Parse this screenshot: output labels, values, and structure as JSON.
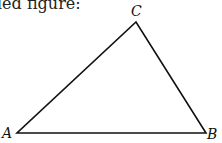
{
  "caption": "led figure:",
  "diagram": {
    "type": "triangle",
    "vertices": [
      {
        "label": "A",
        "x": 17,
        "y": 133
      },
      {
        "label": "B",
        "x": 206,
        "y": 133
      },
      {
        "label": "C",
        "x": 136,
        "y": 22
      }
    ],
    "stroke_color": "#111111"
  }
}
